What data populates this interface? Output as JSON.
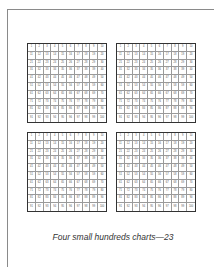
{
  "caption": "Four small hundreds charts—23",
  "charts": [
    {
      "id": "top-left",
      "start": 1,
      "end": 100,
      "columns": 10
    },
    {
      "id": "top-right",
      "start": 1,
      "end": 100,
      "columns": 10
    },
    {
      "id": "bottom-left",
      "start": 1,
      "end": 100,
      "columns": 10
    },
    {
      "id": "bottom-right",
      "start": 1,
      "end": 100,
      "columns": 10
    }
  ],
  "colors": {
    "grid_border": "#333333",
    "cell_line": "#9a9a9a",
    "page_rule": "#8a8a8a"
  }
}
